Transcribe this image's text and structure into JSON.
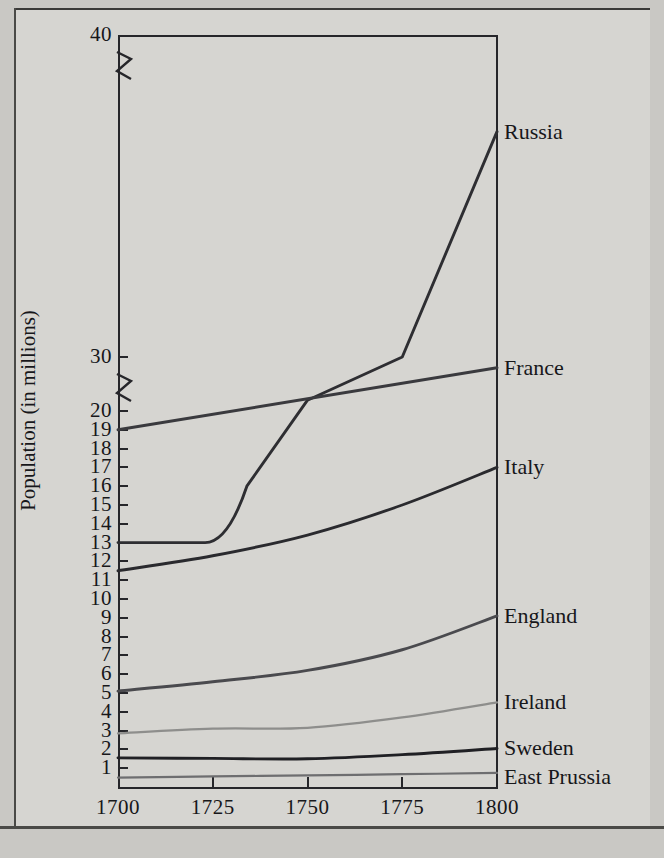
{
  "chart_data": {
    "type": "line",
    "title": "",
    "xlabel": "",
    "ylabel": "Population (in millions)",
    "grid": false,
    "legend_position": "right-inline-labels",
    "axis_break": true,
    "axis_break_note": "y-axis is broken between 20 and 30 and between 30 and 40",
    "xlim": [
      1700,
      1800
    ],
    "ylim": [
      0,
      40
    ],
    "x_ticks": [
      "1700",
      "1725",
      "1750",
      "1775",
      "1800"
    ],
    "y_ticks": [
      "1",
      "2",
      "3",
      "4",
      "5",
      "6",
      "7",
      "8",
      "9",
      "10",
      "11",
      "12",
      "13",
      "14",
      "15",
      "16",
      "17",
      "18",
      "19",
      "20",
      "30",
      "40"
    ],
    "x": [
      1700,
      1725,
      1750,
      1775,
      1800
    ],
    "series": [
      {
        "name": "Russia",
        "color": "#2e2e32",
        "values": [
          13.0,
          13.0,
          22.0,
          30.0,
          37.0
        ]
      },
      {
        "name": "France",
        "color": "#3a3a3e",
        "values": [
          19.0,
          21.5,
          24.0,
          26.2,
          28.0
        ]
      },
      {
        "name": "Italy",
        "color": "#2a2a2e",
        "values": [
          11.5,
          12.3,
          13.4,
          15.0,
          17.0
        ]
      },
      {
        "name": "England",
        "color": "#4a4a4e",
        "values": [
          5.1,
          5.6,
          6.2,
          7.3,
          9.1
        ]
      },
      {
        "name": "Ireland",
        "color": "#8e8e8c",
        "values": [
          2.85,
          3.1,
          3.15,
          3.7,
          4.5
        ]
      },
      {
        "name": "Sweden",
        "color": "#202024",
        "values": [
          1.55,
          1.52,
          1.5,
          1.72,
          2.05
        ]
      },
      {
        "name": "East Prussia",
        "color": "#6e6e70",
        "values": [
          0.5,
          0.56,
          0.62,
          0.68,
          0.75
        ]
      }
    ],
    "series_labels": [
      {
        "name": "Russia",
        "label": "Russia"
      },
      {
        "name": "France",
        "label": "France"
      },
      {
        "name": "Italy",
        "label": "Italy"
      },
      {
        "name": "England",
        "label": "England"
      },
      {
        "name": "Ireland",
        "label": "Ireland"
      },
      {
        "name": "Sweden",
        "label": "Sweden"
      },
      {
        "name": "East Prussia",
        "label": "East Prussia"
      }
    ]
  },
  "colors": {
    "page_background": "#c9c8c4",
    "figure_background": "#d6d5d1",
    "axis": "#26262a",
    "text": "#17171a"
  }
}
